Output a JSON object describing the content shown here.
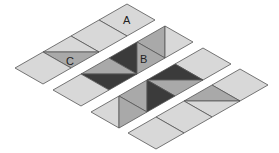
{
  "colors": {
    "background": "#ffffff",
    "light": "#d8d8d8",
    "medium": "#a9a9a9",
    "dark": "#3b3b3b",
    "stroke": "#555555"
  },
  "labels": {
    "A": "A",
    "B": "B",
    "C": "C"
  },
  "strips": [
    {
      "name": "strip-1",
      "cells": [
        {
          "pattern": "plain",
          "label": "A"
        },
        {
          "pattern": "plain"
        },
        {
          "pattern": "horizontal",
          "top": "light",
          "bottom": "medium",
          "label": "C"
        },
        {
          "pattern": "plain"
        }
      ]
    },
    {
      "name": "strip-2",
      "cells": [
        {
          "pattern": "vertical",
          "left": "medium",
          "right": "light"
        },
        {
          "pattern": "vertical",
          "left": "dark",
          "right": "medium",
          "label": "B"
        },
        {
          "pattern": "horizontal",
          "top": "medium",
          "bottom": "dark"
        },
        {
          "pattern": "plain"
        }
      ]
    },
    {
      "name": "strip-3",
      "cells": [
        {
          "pattern": "plain"
        },
        {
          "pattern": "horizontal",
          "top": "dark",
          "bottom": "medium"
        },
        {
          "pattern": "vertical",
          "left": "medium",
          "right": "dark"
        },
        {
          "pattern": "vertical",
          "left": "light",
          "right": "medium"
        }
      ]
    },
    {
      "name": "strip-4",
      "cells": [
        {
          "pattern": "plain"
        },
        {
          "pattern": "horizontal",
          "top": "medium",
          "bottom": "light"
        },
        {
          "pattern": "plain"
        },
        {
          "pattern": "plain"
        }
      ]
    }
  ]
}
